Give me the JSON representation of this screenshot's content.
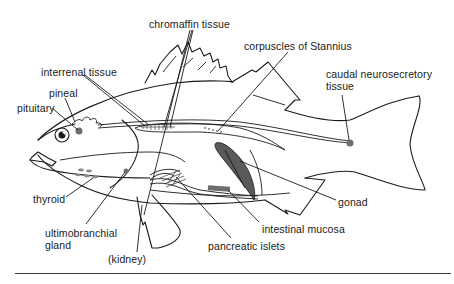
{
  "diagram": {
    "colors": {
      "outline": "#1a1a1a",
      "organ_fill": "#6e6e6e",
      "background": "#ffffff"
    },
    "labels": {
      "chromaffin_tissue": "chromaffin tissue",
      "corpuscles_of_stannius": "corpuscles of Stannius",
      "interrenal_tissue": "interrenal tissue",
      "pineal": "pineal",
      "pituitary": "pituitary",
      "caudal_neurosecretory_line1": "caudal neurosecretory",
      "caudal_neurosecretory_line2": "tissue",
      "thyroid": "thyroid",
      "ultimobranchial_line1": "ultimobranchial",
      "ultimobranchial_line2": "gland",
      "kidney": "(kidney)",
      "pancreatic_islets": "pancreatic islets",
      "intestinal_mucosa": "intestinal mucosa",
      "gonad": "gonad"
    }
  }
}
